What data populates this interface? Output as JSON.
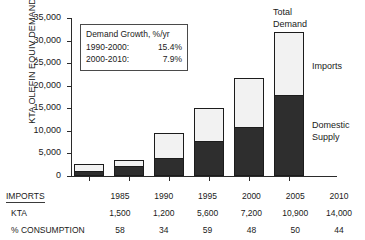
{
  "chart_data": {
    "type": "bar",
    "title": "",
    "xlabel": "",
    "ylabel": "KTA OLEFIN EQUIV DEMAND",
    "ylim": [
      0,
      35000
    ],
    "ytick_labels": [
      "35,000",
      "30,000",
      "25,000",
      "20,000",
      "15,000",
      "10,000",
      "5,000",
      "0"
    ],
    "ytick_values": [
      35000,
      30000,
      25000,
      20000,
      15000,
      10000,
      5000,
      0
    ],
    "grid": false,
    "stacked": true,
    "legend_position": "annotations-right",
    "categories": [
      "1985",
      "1990",
      "1995",
      "2000",
      "2005",
      "2010"
    ],
    "series": [
      {
        "name": "Domestic Supply",
        "values": [
          1100,
          2300,
          3900,
          7800,
          10900,
          18000
        ]
      },
      {
        "name": "Imports",
        "values": [
          1500,
          1200,
          5600,
          7200,
          10900,
          14000
        ]
      }
    ],
    "totals": [
      2600,
      3500,
      9500,
      15000,
      21800,
      32000
    ],
    "annotations": {
      "total_demand": "Total\nDemand",
      "imports": "Imports",
      "domestic_supply": "Domestic\nSupply"
    }
  },
  "y_axis": {
    "title": "KTA OLEFIN EQUIV DEMAND",
    "ticks": [
      {
        "label": "35,000",
        "value": 35000
      },
      {
        "label": "30,000",
        "value": 30000
      },
      {
        "label": "25,000",
        "value": 25000
      },
      {
        "label": "20,000",
        "value": 20000
      },
      {
        "label": "15,000",
        "value": 15000
      },
      {
        "label": "10,000",
        "value": 10000
      },
      {
        "label": "5,000",
        "value": 5000
      },
      {
        "label": "0",
        "value": 0
      }
    ]
  },
  "bars": [
    {
      "category": "1985",
      "domestic": 1100,
      "imports": 1500,
      "total": 2600
    },
    {
      "category": "1990",
      "domestic": 2300,
      "imports": 1200,
      "total": 3500
    },
    {
      "category": "1995",
      "domestic": 3900,
      "imports": 5600,
      "total": 9500
    },
    {
      "category": "2000",
      "domestic": 7800,
      "imports": 7200,
      "total": 15000
    },
    {
      "category": "2005",
      "domestic": 10900,
      "imports": 10900,
      "total": 21800
    },
    {
      "category": "2010",
      "domestic": 18000,
      "imports": 14000,
      "total": 32000
    }
  ],
  "growth_box": {
    "title": "Demand Growth, %/yr",
    "rows": [
      {
        "period": "1990-2000:",
        "rate": "15.4%"
      },
      {
        "period": "2000-2010:",
        "rate": "7.9%"
      }
    ]
  },
  "callouts": {
    "total_line1": "Total",
    "total_line2": "Demand",
    "imports": "Imports",
    "domestic_line1": "Domestic",
    "domestic_line2": "Supply"
  },
  "table": {
    "header_label": "IMPORTS",
    "years": [
      "1985",
      "1990",
      "1995",
      "2000",
      "2005",
      "2010"
    ],
    "rows": [
      {
        "label": "KTA",
        "values": [
          "1,500",
          "1,200",
          "5,600",
          "7,200",
          "10,900",
          "14,000"
        ]
      },
      {
        "label": "% CONSUMPTION",
        "values": [
          "58",
          "34",
          "59",
          "48",
          "50",
          "44"
        ]
      }
    ]
  },
  "colors": {
    "domestic_supply": "#2e2e2e",
    "imports": "#f2f2f2",
    "axis": "#2b2b2b",
    "text": "#1a1a1a",
    "background": "#ffffff"
  }
}
